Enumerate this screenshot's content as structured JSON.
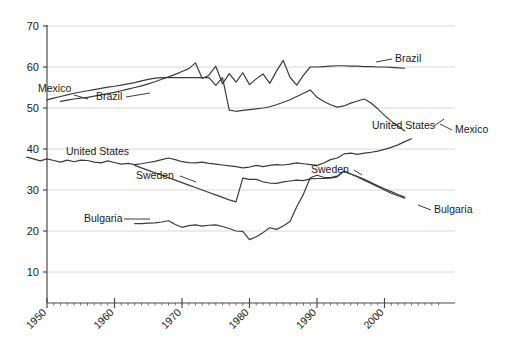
{
  "chart_data": {
    "type": "line",
    "title": "",
    "subtitle": "",
    "xlabel": "",
    "ylabel": "",
    "xlim": [
      1946,
      2008
    ],
    "ylim": [
      0,
      72
    ],
    "grid": true,
    "grid_axis": "y",
    "legend_position": "inline-labels",
    "y_ticks": [
      10,
      20,
      30,
      40,
      50,
      60,
      70
    ],
    "y_tick_labels": [
      "10",
      "20",
      "30",
      "40",
      "50",
      "60",
      "70"
    ],
    "x_ticks": [
      1950,
      1960,
      1970,
      1980,
      1990,
      2000
    ],
    "x_tick_labels": [
      "1950",
      "1960",
      "1970",
      "1980",
      "1990",
      "2000"
    ],
    "x_minor_tick_interval": 1,
    "line_color": "#3b3b3b",
    "grid_color": "#d8d8d8",
    "axis_color": "#4a4a4a",
    "series": [
      {
        "name": "Mexico",
        "label_left": "Mexico",
        "label_right": "Mexico",
        "x": [
          1950,
          1951,
          1952,
          1953,
          1954,
          1955,
          1956,
          1957,
          1958,
          1959,
          1960,
          1961,
          1962,
          1963,
          1964,
          1965,
          1966,
          1967,
          1968,
          1969,
          1970,
          1971,
          1972,
          1973,
          1974,
          1975,
          1976,
          1977,
          1978,
          1979,
          1980,
          1981,
          1982,
          1983,
          1984,
          1985,
          1986,
          1987,
          1988,
          1989,
          1990,
          1991,
          1992,
          1993,
          1994,
          1995,
          1996,
          1997,
          1998,
          1999,
          2000,
          2001,
          2002,
          2003
        ],
        "values": [
          52.0,
          52.4,
          52.8,
          53.2,
          53.6,
          53.9,
          54.2,
          54.5,
          54.8,
          55.1,
          55.3,
          55.6,
          55.9,
          56.2,
          56.6,
          57.0,
          57.3,
          57.4,
          57.4,
          57.4,
          57.4,
          57.4,
          57.4,
          57.4,
          57.4,
          55.5,
          57.4,
          49.5,
          49.2,
          49.4,
          49.6,
          49.8,
          50.0,
          50.3,
          50.8,
          51.4,
          52.0,
          52.8,
          53.6,
          54.4,
          52.6,
          51.6,
          50.8,
          50.2,
          50.5,
          51.2,
          51.7,
          52.2,
          51.2,
          49.8,
          48.2,
          46.8,
          45.6,
          44.4
        ]
      },
      {
        "name": "Brazil",
        "label_left": "Brazil",
        "label_right": "Brazil",
        "x": [
          1952,
          1953,
          1954,
          1955,
          1956,
          1957,
          1958,
          1959,
          1960,
          1961,
          1962,
          1963,
          1964,
          1965,
          1966,
          1967,
          1968,
          1969,
          1970,
          1971,
          1972,
          1973,
          1974,
          1975,
          1976,
          1977,
          1978,
          1979,
          1980,
          1981,
          1982,
          1983,
          1984,
          1985,
          1986,
          1987,
          1988,
          1989,
          1990,
          1991,
          1992,
          1993,
          1994,
          1995,
          1996,
          1997,
          1998,
          1999,
          2000,
          2001,
          2002,
          2003
        ],
        "values": [
          51.6,
          51.9,
          52.2,
          52.4,
          52.6,
          52.9,
          53.2,
          53.5,
          53.8,
          54.2,
          54.6,
          55.0,
          55.4,
          55.9,
          56.4,
          57.0,
          57.6,
          58.2,
          58.9,
          59.6,
          61.0,
          57.2,
          58.0,
          60.2,
          55.9,
          58.4,
          56.3,
          58.6,
          55.7,
          57.1,
          58.3,
          56.0,
          59.0,
          61.6,
          57.5,
          55.6,
          58.0,
          60.0,
          60.0,
          60.1,
          60.2,
          60.3,
          60.3,
          60.2,
          60.2,
          60.1,
          60.1,
          60.0,
          60.0,
          59.9,
          59.8,
          59.7
        ]
      },
      {
        "name": "United States",
        "label_left": "United States",
        "label_right": "United States",
        "x": [
          1947,
          1948,
          1949,
          1950,
          1951,
          1952,
          1953,
          1954,
          1955,
          1956,
          1957,
          1958,
          1959,
          1960,
          1961,
          1962,
          1963,
          1964,
          1965,
          1966,
          1967,
          1968,
          1969,
          1970,
          1971,
          1972,
          1973,
          1974,
          1975,
          1976,
          1977,
          1978,
          1979,
          1980,
          1981,
          1982,
          1983,
          1984,
          1985,
          1986,
          1987,
          1988,
          1989,
          1990,
          1991,
          1992,
          1993,
          1994,
          1995,
          1996,
          1997,
          1998,
          1999,
          2000,
          2001,
          2002,
          2003,
          2004
        ],
        "values": [
          38.0,
          37.6,
          37.1,
          37.6,
          37.2,
          36.8,
          37.3,
          36.9,
          37.3,
          37.2,
          36.8,
          36.6,
          37.1,
          36.7,
          36.3,
          36.5,
          36.2,
          36.4,
          36.7,
          37.0,
          37.4,
          37.8,
          37.4,
          36.9,
          36.7,
          36.6,
          36.8,
          36.5,
          36.3,
          36.1,
          35.9,
          35.7,
          35.4,
          35.6,
          36.0,
          35.7,
          36.0,
          36.2,
          36.1,
          36.3,
          36.6,
          36.4,
          36.2,
          36.0,
          36.6,
          37.4,
          37.8,
          38.8,
          39.0,
          38.7,
          39.0,
          39.2,
          39.5,
          39.9,
          40.4,
          41.0,
          41.8,
          42.5
        ]
      },
      {
        "name": "Sweden",
        "label_left": "Sweden",
        "label_right": "Sweden",
        "x": [
          1963,
          1964,
          1965,
          1966,
          1967,
          1968,
          1969,
          1970,
          1971,
          1972,
          1973,
          1974,
          1975,
          1976,
          1977,
          1978,
          1979,
          1980,
          1981,
          1982,
          1983,
          1984,
          1985,
          1986,
          1987,
          1988,
          1989,
          1990,
          1991,
          1992,
          1993,
          1994,
          1995,
          1996,
          1997,
          1998,
          1999,
          2000,
          2001,
          2002,
          2003
        ],
        "values": [
          36.0,
          35.4,
          34.8,
          34.2,
          33.6,
          33.0,
          32.4,
          31.8,
          31.2,
          30.6,
          30.0,
          29.4,
          28.8,
          28.2,
          27.6,
          27.1,
          32.9,
          32.6,
          32.6,
          32.0,
          31.7,
          31.6,
          32.0,
          32.2,
          32.4,
          32.3,
          32.7,
          32.8,
          32.8,
          32.9,
          33.2,
          34.6,
          33.9,
          33.3,
          32.6,
          31.8,
          31.0,
          30.3,
          29.6,
          28.9,
          28.2
        ]
      },
      {
        "name": "Bulgaria",
        "label_left": "Bulgaria",
        "label_right": "Bulgaria",
        "x": [
          1963,
          1964,
          1965,
          1966,
          1967,
          1968,
          1969,
          1970,
          1971,
          1972,
          1973,
          1974,
          1975,
          1976,
          1977,
          1978,
          1979,
          1980,
          1981,
          1982,
          1983,
          1984,
          1985,
          1986,
          1987,
          1988,
          1989,
          1990,
          1991,
          1992,
          1993,
          1994,
          1995,
          1996,
          1997,
          1998,
          1999,
          2000,
          2001,
          2002,
          2003
        ],
        "values": [
          21.8,
          21.8,
          21.9,
          22.0,
          22.2,
          22.5,
          21.6,
          20.9,
          21.3,
          21.5,
          21.2,
          21.4,
          21.5,
          21.1,
          20.6,
          20.0,
          19.9,
          17.9,
          18.6,
          19.6,
          20.8,
          20.4,
          21.2,
          22.3,
          25.9,
          29.0,
          33.0,
          33.6,
          33.1,
          33.0,
          33.4,
          34.6,
          33.9,
          33.2,
          32.4,
          31.6,
          30.8,
          30.0,
          29.2,
          28.6,
          28.0
        ]
      }
    ],
    "annotations": [
      {
        "name": "mexico-left-label",
        "text": "Mexico",
        "x_px": 38,
        "y_px": 92
      },
      {
        "name": "brazil-left-label",
        "text": "Brazil",
        "x_px": 96,
        "y_px": 100
      },
      {
        "name": "brazil-right-label",
        "text": "Brazil",
        "x_px": 395,
        "y_px": 62
      },
      {
        "name": "united-states-left-label",
        "text": "United States",
        "x_px": 66,
        "y_px": 155
      },
      {
        "name": "united-states-right-label",
        "text": "United States",
        "x_px": 372,
        "y_px": 129
      },
      {
        "name": "mexico-right-label",
        "text": "Mexico",
        "x_px": 455,
        "y_px": 133
      },
      {
        "name": "sweden-left-label",
        "text": "Sweden",
        "x_px": 136,
        "y_px": 179
      },
      {
        "name": "sweden-right-label",
        "text": "Sweden",
        "x_px": 311,
        "y_px": 173
      },
      {
        "name": "bulgaria-left-label",
        "text": "Bulgaria",
        "x_px": 84,
        "y_px": 222
      },
      {
        "name": "bulgaria-right-label",
        "text": "Bulgaria",
        "x_px": 434,
        "y_px": 213
      }
    ]
  }
}
